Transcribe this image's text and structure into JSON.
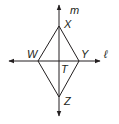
{
  "diagram": {
    "type": "geometry-figure",
    "lines": {
      "vertical": {
        "label": "m"
      },
      "horizontal": {
        "label": "ℓ"
      }
    },
    "points": {
      "X": {
        "label": "X"
      },
      "Y": {
        "label": "Y"
      },
      "Z": {
        "label": "Z"
      },
      "W": {
        "label": "W"
      },
      "T": {
        "label": "T"
      }
    },
    "colors": {
      "stroke": "#231f20",
      "background": "#ffffff"
    }
  }
}
